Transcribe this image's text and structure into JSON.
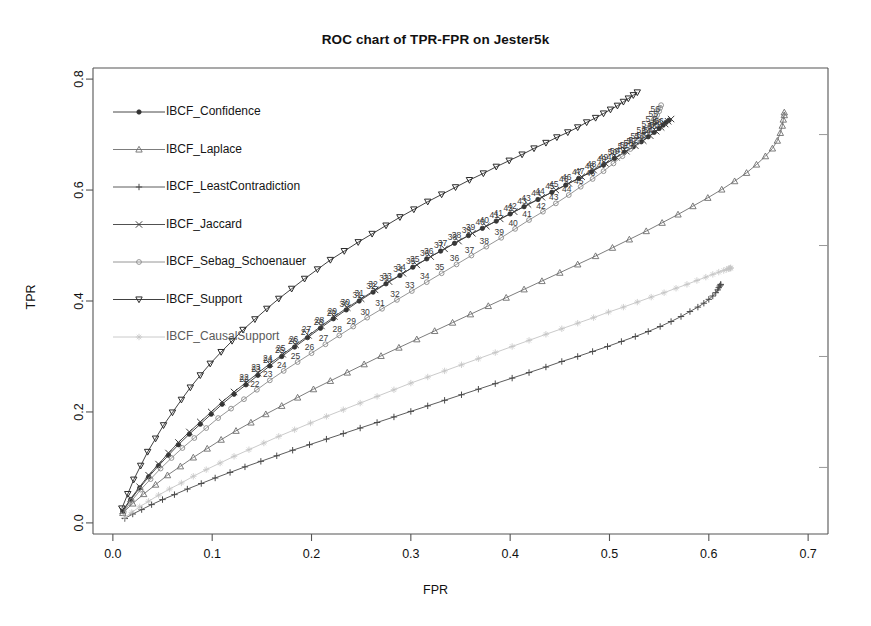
{
  "chart_data": {
    "type": "line",
    "title": "ROC chart of TPR-FPR on Jester5k",
    "xlabel": "FPR",
    "ylabel": "TPR",
    "xlim": [
      -0.02,
      0.72
    ],
    "ylim": [
      -0.02,
      0.82
    ],
    "xticks": [
      "0.0",
      "0.1",
      "0.2",
      "0.3",
      "0.4",
      "0.5",
      "0.6",
      "0.7"
    ],
    "xtick_values": [
      0.0,
      0.1,
      0.2,
      0.3,
      0.4,
      0.5,
      0.6,
      0.7
    ],
    "yticks": [
      "0.0",
      "0.2",
      "0.4",
      "0.6",
      "0.8"
    ],
    "ytick_values": [
      0.0,
      0.2,
      0.4,
      0.6,
      0.8
    ],
    "yminor_values": [
      0.1,
      0.3,
      0.5,
      0.7
    ],
    "grid": false,
    "legend_position": "top-left",
    "point_labels_shown": true,
    "series": [
      {
        "name": "IBCF_Confidence",
        "marker": "filled-circle",
        "color": "#333333",
        "x": [
          0.01,
          0.018,
          0.027,
          0.036,
          0.046,
          0.056,
          0.066,
          0.077,
          0.088,
          0.099,
          0.11,
          0.122,
          0.134,
          0.146,
          0.158,
          0.17,
          0.183,
          0.196,
          0.209,
          0.222,
          0.235,
          0.248,
          0.262,
          0.275,
          0.289,
          0.302,
          0.316,
          0.33,
          0.344,
          0.358,
          0.372,
          0.386,
          0.4,
          0.414,
          0.428,
          0.442,
          0.456,
          0.469,
          0.482,
          0.494,
          0.505,
          0.515,
          0.524,
          0.532,
          0.539,
          0.545,
          0.55,
          0.554,
          0.557,
          0.56
        ],
        "y": [
          0.021,
          0.042,
          0.063,
          0.083,
          0.103,
          0.122,
          0.141,
          0.16,
          0.178,
          0.196,
          0.214,
          0.232,
          0.249,
          0.266,
          0.283,
          0.3,
          0.317,
          0.334,
          0.351,
          0.368,
          0.384,
          0.4,
          0.416,
          0.431,
          0.446,
          0.461,
          0.476,
          0.49,
          0.504,
          0.518,
          0.531,
          0.544,
          0.557,
          0.57,
          0.583,
          0.596,
          0.609,
          0.621,
          0.633,
          0.645,
          0.657,
          0.668,
          0.678,
          0.687,
          0.696,
          0.704,
          0.711,
          0.717,
          0.722,
          0.726
        ]
      },
      {
        "name": "IBCF_Laplace",
        "marker": "triangle-up",
        "color": "#6e6e6e",
        "x": [
          0.01,
          0.02,
          0.031,
          0.043,
          0.055,
          0.068,
          0.081,
          0.095,
          0.109,
          0.124,
          0.139,
          0.154,
          0.17,
          0.186,
          0.202,
          0.219,
          0.236,
          0.253,
          0.27,
          0.288,
          0.306,
          0.324,
          0.342,
          0.36,
          0.378,
          0.396,
          0.414,
          0.432,
          0.45,
          0.468,
          0.486,
          0.503,
          0.52,
          0.537,
          0.553,
          0.569,
          0.584,
          0.599,
          0.613,
          0.626,
          0.638,
          0.648,
          0.657,
          0.664,
          0.669,
          0.672,
          0.674,
          0.675,
          0.676,
          0.676
        ],
        "y": [
          0.018,
          0.035,
          0.052,
          0.069,
          0.086,
          0.102,
          0.118,
          0.134,
          0.15,
          0.166,
          0.181,
          0.196,
          0.211,
          0.226,
          0.241,
          0.256,
          0.271,
          0.286,
          0.301,
          0.316,
          0.331,
          0.346,
          0.361,
          0.376,
          0.391,
          0.406,
          0.421,
          0.436,
          0.451,
          0.466,
          0.481,
          0.496,
          0.511,
          0.526,
          0.541,
          0.556,
          0.571,
          0.586,
          0.601,
          0.616,
          0.631,
          0.646,
          0.661,
          0.675,
          0.689,
          0.703,
          0.716,
          0.727,
          0.735,
          0.74
        ]
      },
      {
        "name": "IBCF_LeastContradiction",
        "marker": "plus",
        "color": "#4a4a4a",
        "x": [
          0.012,
          0.02,
          0.029,
          0.039,
          0.05,
          0.062,
          0.075,
          0.089,
          0.103,
          0.118,
          0.133,
          0.149,
          0.165,
          0.181,
          0.198,
          0.215,
          0.232,
          0.249,
          0.266,
          0.283,
          0.3,
          0.317,
          0.334,
          0.351,
          0.368,
          0.385,
          0.402,
          0.419,
          0.436,
          0.452,
          0.468,
          0.483,
          0.498,
          0.512,
          0.526,
          0.539,
          0.551,
          0.562,
          0.572,
          0.581,
          0.589,
          0.595,
          0.6,
          0.604,
          0.607,
          0.609,
          0.61,
          0.611,
          0.612,
          0.612
        ],
        "y": [
          0.008,
          0.016,
          0.024,
          0.033,
          0.042,
          0.051,
          0.061,
          0.071,
          0.081,
          0.091,
          0.101,
          0.111,
          0.121,
          0.131,
          0.141,
          0.151,
          0.161,
          0.171,
          0.181,
          0.191,
          0.201,
          0.211,
          0.221,
          0.231,
          0.241,
          0.251,
          0.261,
          0.271,
          0.281,
          0.291,
          0.3,
          0.309,
          0.318,
          0.327,
          0.336,
          0.345,
          0.354,
          0.363,
          0.372,
          0.381,
          0.389,
          0.396,
          0.403,
          0.409,
          0.415,
          0.42,
          0.424,
          0.427,
          0.429,
          0.43
        ]
      },
      {
        "name": "IBCF_Jaccard",
        "marker": "cross",
        "color": "#3d3d3d",
        "x": [
          0.01,
          0.018,
          0.027,
          0.036,
          0.046,
          0.056,
          0.066,
          0.077,
          0.088,
          0.099,
          0.11,
          0.122,
          0.134,
          0.146,
          0.158,
          0.171,
          0.184,
          0.197,
          0.21,
          0.223,
          0.236,
          0.25,
          0.264,
          0.278,
          0.292,
          0.306,
          0.32,
          0.334,
          0.348,
          0.362,
          0.376,
          0.39,
          0.404,
          0.418,
          0.432,
          0.446,
          0.459,
          0.472,
          0.484,
          0.496,
          0.507,
          0.517,
          0.526,
          0.534,
          0.541,
          0.547,
          0.552,
          0.556,
          0.559,
          0.562
        ],
        "y": [
          0.022,
          0.044,
          0.065,
          0.086,
          0.106,
          0.126,
          0.145,
          0.164,
          0.182,
          0.2,
          0.218,
          0.236,
          0.253,
          0.27,
          0.287,
          0.304,
          0.321,
          0.338,
          0.355,
          0.372,
          0.388,
          0.404,
          0.42,
          0.435,
          0.45,
          0.465,
          0.48,
          0.494,
          0.508,
          0.522,
          0.535,
          0.548,
          0.561,
          0.574,
          0.587,
          0.6,
          0.612,
          0.624,
          0.636,
          0.648,
          0.659,
          0.67,
          0.68,
          0.689,
          0.698,
          0.706,
          0.713,
          0.719,
          0.724,
          0.728
        ]
      },
      {
        "name": "IBCF_Sebag_Schoenauer",
        "marker": "open-circle",
        "color": "#8a8a8a",
        "x": [
          0.011,
          0.019,
          0.028,
          0.038,
          0.048,
          0.059,
          0.07,
          0.082,
          0.094,
          0.106,
          0.119,
          0.132,
          0.145,
          0.158,
          0.172,
          0.186,
          0.2,
          0.214,
          0.228,
          0.242,
          0.256,
          0.271,
          0.286,
          0.301,
          0.316,
          0.331,
          0.346,
          0.361,
          0.376,
          0.391,
          0.405,
          0.419,
          0.433,
          0.446,
          0.459,
          0.471,
          0.483,
          0.494,
          0.504,
          0.513,
          0.521,
          0.528,
          0.534,
          0.539,
          0.543,
          0.546,
          0.548,
          0.55,
          0.551,
          0.552
        ],
        "y": [
          0.02,
          0.04,
          0.06,
          0.079,
          0.098,
          0.117,
          0.135,
          0.153,
          0.171,
          0.189,
          0.206,
          0.223,
          0.24,
          0.257,
          0.274,
          0.29,
          0.306,
          0.322,
          0.338,
          0.354,
          0.37,
          0.386,
          0.402,
          0.418,
          0.434,
          0.45,
          0.466,
          0.482,
          0.498,
          0.514,
          0.53,
          0.546,
          0.561,
          0.576,
          0.591,
          0.606,
          0.62,
          0.634,
          0.648,
          0.661,
          0.674,
          0.686,
          0.697,
          0.708,
          0.718,
          0.727,
          0.735,
          0.742,
          0.748,
          0.753
        ]
      },
      {
        "name": "IBCF_Support",
        "marker": "triangle-down",
        "color": "#2b2b2b",
        "x": [
          0.009,
          0.015,
          0.021,
          0.028,
          0.035,
          0.043,
          0.051,
          0.06,
          0.069,
          0.078,
          0.088,
          0.098,
          0.109,
          0.12,
          0.131,
          0.143,
          0.155,
          0.167,
          0.18,
          0.193,
          0.206,
          0.219,
          0.233,
          0.247,
          0.261,
          0.275,
          0.289,
          0.303,
          0.317,
          0.331,
          0.345,
          0.359,
          0.373,
          0.386,
          0.399,
          0.412,
          0.424,
          0.436,
          0.447,
          0.458,
          0.468,
          0.477,
          0.486,
          0.494,
          0.501,
          0.508,
          0.514,
          0.519,
          0.524,
          0.528
        ],
        "y": [
          0.026,
          0.052,
          0.078,
          0.103,
          0.128,
          0.152,
          0.176,
          0.199,
          0.222,
          0.244,
          0.266,
          0.287,
          0.308,
          0.328,
          0.348,
          0.367,
          0.386,
          0.404,
          0.422,
          0.44,
          0.457,
          0.474,
          0.49,
          0.506,
          0.521,
          0.536,
          0.551,
          0.565,
          0.579,
          0.592,
          0.605,
          0.618,
          0.63,
          0.642,
          0.653,
          0.664,
          0.675,
          0.685,
          0.695,
          0.704,
          0.713,
          0.722,
          0.73,
          0.738,
          0.745,
          0.752,
          0.759,
          0.765,
          0.771,
          0.776
        ]
      },
      {
        "name": "IBCF_CausalSupport",
        "marker": "faint-star",
        "color": "#c4c4c4",
        "x": [
          0.012,
          0.019,
          0.027,
          0.036,
          0.046,
          0.057,
          0.069,
          0.081,
          0.094,
          0.108,
          0.122,
          0.137,
          0.152,
          0.167,
          0.183,
          0.199,
          0.215,
          0.232,
          0.249,
          0.266,
          0.283,
          0.3,
          0.317,
          0.334,
          0.351,
          0.368,
          0.385,
          0.402,
          0.419,
          0.436,
          0.452,
          0.468,
          0.484,
          0.499,
          0.514,
          0.528,
          0.542,
          0.555,
          0.567,
          0.578,
          0.588,
          0.597,
          0.604,
          0.61,
          0.615,
          0.618,
          0.62,
          0.621,
          0.622,
          0.622
        ],
        "y": [
          0.01,
          0.019,
          0.029,
          0.039,
          0.05,
          0.061,
          0.072,
          0.084,
          0.096,
          0.108,
          0.12,
          0.132,
          0.144,
          0.156,
          0.168,
          0.18,
          0.192,
          0.204,
          0.216,
          0.228,
          0.24,
          0.252,
          0.263,
          0.274,
          0.285,
          0.296,
          0.307,
          0.318,
          0.329,
          0.34,
          0.35,
          0.36,
          0.37,
          0.38,
          0.389,
          0.398,
          0.407,
          0.415,
          0.423,
          0.43,
          0.437,
          0.443,
          0.448,
          0.452,
          0.455,
          0.457,
          0.458,
          0.459,
          0.459,
          0.46
        ]
      }
    ]
  },
  "legend": {
    "entries": [
      {
        "label": "IBCF_Confidence"
      },
      {
        "label": "IBCF_Laplace"
      },
      {
        "label": "IBCF_LeastContradiction"
      },
      {
        "label": "IBCF_Jaccard"
      },
      {
        "label": "IBCF_Sebag_Schoenauer"
      },
      {
        "label": "IBCF_Support"
      },
      {
        "label": "IBCF_CausalSupport"
      }
    ]
  }
}
